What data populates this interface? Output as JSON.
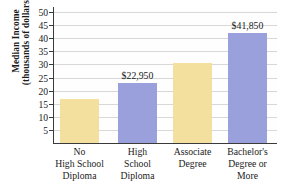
{
  "chart_data": {
    "type": "bar",
    "title": "",
    "xlabel": "",
    "ylabel": "Median Income (thousands of dollars)",
    "ylabel_lines": [
      "Median Income",
      "(thousands of dollars)"
    ],
    "categories": [
      "No High School Diploma",
      "High School Diploma",
      "Associate Degree",
      "Bachelor's Degree or More"
    ],
    "category_lines": [
      [
        "No",
        "High School",
        "Diploma"
      ],
      [
        "High",
        "School",
        "Diploma"
      ],
      [
        "Associate",
        "Degree"
      ],
      [
        "Bachelor's",
        "Degree or",
        "More"
      ]
    ],
    "values": [
      16.9,
      22.95,
      30.5,
      41.85
    ],
    "data_labels": [
      "",
      "$22,950",
      "",
      "$41,850"
    ],
    "bar_colors": [
      "#f3df9e",
      "#9aa0dc",
      "#f3df9e",
      "#9aa0dc"
    ],
    "ylim": [
      0,
      50
    ],
    "yticks": [
      5,
      10,
      15,
      20,
      25,
      30,
      35,
      40,
      45,
      50
    ],
    "ytick_labels": [
      "5",
      "10",
      "15",
      "20",
      "25",
      "30",
      "35",
      "40",
      "45",
      "50"
    ],
    "grid": true,
    "legend": "none"
  },
  "colors": {
    "bar_yellow": "#f3df9e",
    "bar_blue": "#9aa0dc",
    "axis": "#3a3a3a",
    "grid": "#d8d8d8",
    "text": "#1a1a1a",
    "background": "#ffffff"
  }
}
